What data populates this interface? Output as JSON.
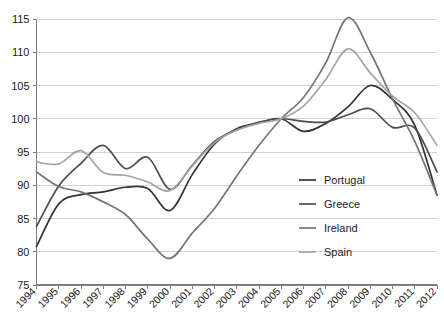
{
  "chart_data": {
    "type": "line",
    "title": "",
    "subtitle": "",
    "xlabel": "",
    "ylabel": "",
    "xlim": [
      1994,
      2012
    ],
    "ylim": [
      75,
      115
    ],
    "yticks": [
      75,
      80,
      85,
      90,
      95,
      100,
      105,
      110,
      115
    ],
    "ytick_labels": [
      "75",
      "80",
      "85",
      "90",
      "95",
      "100",
      "105",
      "110",
      "115"
    ],
    "x": [
      1994,
      1995,
      1996,
      1997,
      1998,
      1999,
      2000,
      2001,
      2002,
      2003,
      2004,
      2005,
      2006,
      2007,
      2008,
      2009,
      2010,
      2011,
      2012
    ],
    "xtick_labels": [
      "1994",
      "1995",
      "1996",
      "1997",
      "1998",
      "1999",
      "2000",
      "2001",
      "2002",
      "2003",
      "2004",
      "2005",
      "2006",
      "2007",
      "2008",
      "2009",
      "2010",
      "2011",
      "2012"
    ],
    "grid": "horizontal",
    "legend_position": "inside-right",
    "series": [
      {
        "name": "Portugal",
        "color": "#333333",
        "values": [
          80.8,
          87.2,
          88.6,
          89.0,
          89.7,
          89.5,
          86.2,
          91.6,
          96.2,
          98.5,
          99.4,
          100.0,
          98.1,
          99.3,
          101.8,
          105.0,
          102.9,
          99.0,
          88.5
        ]
      },
      {
        "name": "Greece",
        "color": "#4d4d4d",
        "values": [
          83.8,
          89.9,
          93.3,
          96.0,
          92.5,
          94.2,
          89.4,
          93.0,
          96.6,
          98.3,
          99.5,
          100.0,
          99.6,
          99.5,
          100.6,
          101.5,
          98.7,
          98.6,
          92.0
        ]
      },
      {
        "name": "Ireland",
        "color": "#767676",
        "values": [
          92.0,
          89.8,
          89.0,
          87.5,
          85.6,
          81.9,
          79.0,
          82.8,
          86.5,
          91.4,
          96.0,
          100.0,
          103.2,
          108.4,
          115.2,
          110.0,
          103.0,
          96.6,
          88.5
        ]
      },
      {
        "name": "Spain",
        "color": "#a5a5a5",
        "values": [
          93.5,
          93.2,
          95.2,
          91.9,
          91.5,
          90.5,
          89.2,
          92.9,
          96.4,
          98.3,
          99.3,
          100.0,
          101.9,
          105.9,
          110.5,
          106.9,
          103.4,
          100.9,
          96.0
        ]
      }
    ]
  },
  "legend": {
    "items": [
      {
        "label": "Portugal"
      },
      {
        "label": "Greece"
      },
      {
        "label": "Ireland"
      },
      {
        "label": "Spain"
      }
    ]
  },
  "axes": {
    "y_axis_name": "value-axis",
    "x_axis_name": "year-axis"
  }
}
